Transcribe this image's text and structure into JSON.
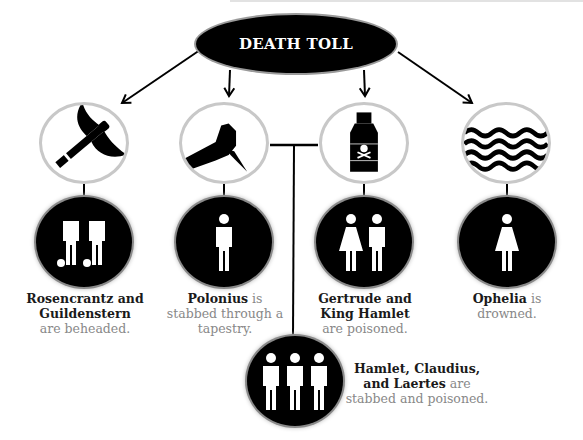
{
  "title": "DEATH TOLL",
  "colors": {
    "fill": "#000000",
    "ring_weapon": "#c8c8c8",
    "ring_victim": "#8a8a8a",
    "caption_bold": "#1a1a1a",
    "caption_light": "#888888"
  },
  "weapons": [
    {
      "name": "axe",
      "icon": "axe-icon"
    },
    {
      "name": "dagger",
      "icon": "hand-dagger-icon"
    },
    {
      "name": "poison",
      "icon": "poison-bottle-icon"
    },
    {
      "name": "water",
      "icon": "waves-icon"
    }
  ],
  "victims": [
    {
      "bold": "Rosencrantz and Guildenstern",
      "rest": "are beheaded.",
      "figures": [
        "male-beheaded",
        "male-beheaded"
      ]
    },
    {
      "bold": "Polonius",
      "rest_inline": " is",
      "rest": "stabbed through a tapestry.",
      "figures": [
        "male"
      ]
    },
    {
      "bold": "Gertrude and King Hamlet",
      "rest": "are poisoned.",
      "figures": [
        "female",
        "male"
      ]
    },
    {
      "bold": "Ophelia",
      "rest_inline": " is",
      "rest": "drowned.",
      "figures": [
        "female"
      ]
    },
    {
      "bold": "Hamlet, Claudius, and Laertes",
      "rest_inline": " are",
      "rest": "stabbed and poisoned.",
      "figures": [
        "male",
        "male",
        "male"
      ]
    }
  ]
}
